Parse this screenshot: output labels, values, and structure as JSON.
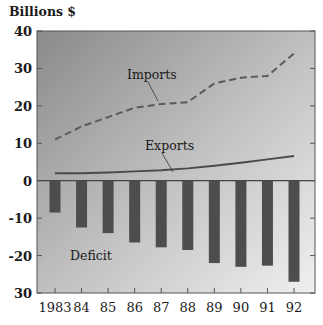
{
  "chart_data": {
    "type": "bar+line",
    "title": "",
    "unit_label": "Billions $",
    "xlabel": "",
    "ylabel": "Billions $",
    "ylim": [
      -30,
      40
    ],
    "yticks": [
      40,
      30,
      20,
      10,
      0,
      -10,
      -20,
      -30
    ],
    "ytick_labels": [
      "40",
      "30",
      "20",
      "10",
      "0",
      "-10",
      "-20",
      "30"
    ],
    "categories": [
      "1983",
      "84",
      "85",
      "86",
      "87",
      "88",
      "89",
      "90",
      "91",
      "92"
    ],
    "grid": false,
    "legend": "inline labels",
    "series": [
      {
        "name": "Imports",
        "type": "line",
        "style": "dashed",
        "values": [
          11,
          14.5,
          17,
          19.5,
          20.5,
          21,
          26,
          27.5,
          28,
          34
        ]
      },
      {
        "name": "Exports",
        "type": "line",
        "style": "solid",
        "values": [
          2,
          2,
          2.2,
          2.5,
          2.8,
          3.3,
          4,
          4.8,
          5.7,
          6.6
        ]
      },
      {
        "name": "Deficit",
        "type": "bar",
        "values": [
          -8.5,
          -12.5,
          -14,
          -16.5,
          -17.8,
          -18.5,
          -22,
          -23,
          -22.7,
          -27
        ]
      }
    ],
    "colors": {
      "imports": "#5a5a5a",
      "exports": "#4a4a4a",
      "deficit": "#4d4d4d",
      "background_top": "#8e8e8e",
      "background_bottom": "#efefef"
    }
  }
}
